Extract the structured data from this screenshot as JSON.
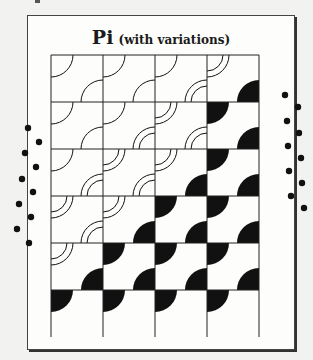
{
  "title": {
    "main": "Pi",
    "sub": "(with variations)"
  },
  "colors": {
    "ink": "#111111",
    "paper": "#fdfdfb",
    "background": "#f2f2f0",
    "dot": "#111111"
  },
  "grid": {
    "cols": 4,
    "rows": 6,
    "cell_width": 52,
    "cell_height": 47,
    "arc_radius": 22,
    "cells": [
      [
        [
          "s",
          "s"
        ],
        [
          "s",
          "s"
        ],
        [
          "s",
          "d"
        ],
        [
          "d",
          "f"
        ]
      ],
      [
        [
          "s",
          "s"
        ],
        [
          "s",
          "d"
        ],
        [
          "d",
          "d"
        ],
        [
          "f",
          "f"
        ]
      ],
      [
        [
          "s",
          "d"
        ],
        [
          "d",
          "d"
        ],
        [
          "d",
          "f"
        ],
        [
          "f",
          "f"
        ]
      ],
      [
        [
          "d",
          "d"
        ],
        [
          "d",
          "f"
        ],
        [
          "f",
          "f"
        ],
        [
          "f",
          "f"
        ]
      ],
      [
        [
          "d",
          "f"
        ],
        [
          "f",
          "f"
        ],
        [
          "f",
          "f"
        ],
        [
          "f",
          "f"
        ]
      ],
      [
        [
          "f",
          "n"
        ],
        [
          "f",
          "n"
        ],
        [
          "f",
          "n"
        ],
        [
          "f",
          "n"
        ]
      ]
    ]
  },
  "binding_holes": {
    "left": [
      [
        28,
        128
      ],
      [
        39,
        142
      ],
      [
        25,
        153
      ],
      [
        36,
        167
      ],
      [
        22,
        179
      ],
      [
        33,
        192
      ],
      [
        19,
        204
      ],
      [
        31,
        217
      ],
      [
        17,
        229
      ],
      [
        29,
        243
      ]
    ],
    "right": [
      [
        285,
        95
      ],
      [
        298,
        107
      ],
      [
        287,
        121
      ],
      [
        299,
        133
      ],
      [
        288,
        146
      ],
      [
        301,
        158
      ],
      [
        289,
        171
      ],
      [
        302,
        183
      ],
      [
        291,
        196
      ],
      [
        304,
        208
      ]
    ]
  }
}
